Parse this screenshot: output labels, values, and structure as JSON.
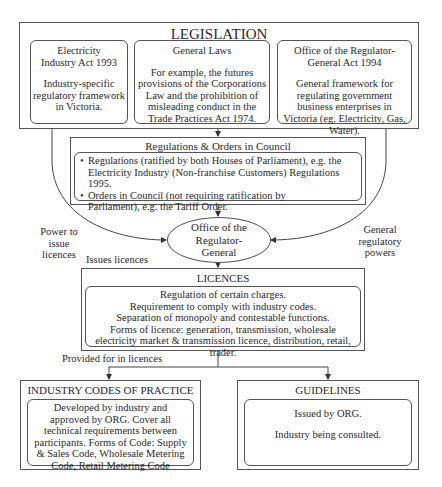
{
  "legislation": {
    "title": "LEGISLATION",
    "items": [
      {
        "heading": "Electricity Industry Act 1993",
        "body": "Industry-specific regulatory framework in Victoria."
      },
      {
        "heading": "General Laws",
        "body": "For example, the futures provisions of the Corporations Law and the prohibition of misleading conduct in the Trade Practices Act 1974."
      },
      {
        "heading": "Office of the Regulator-General Act 1994",
        "body": "General framework for regulating government business enterprises in Victoria (eg. Electricity, Gas, Water)."
      }
    ]
  },
  "regulations": {
    "title": "Regulations & Orders in Council",
    "bullets": [
      "Regulations (ratified by both Houses of Parliament), e.g. the Electricity Industry (Non-franchise Customers) Regulations 1995.",
      "Orders in Council (not requiring ratification by Parliament), e.g. the Tariff Order."
    ]
  },
  "org": {
    "label": "Office of the Regulator-General"
  },
  "edge_labels": {
    "power_to_issue": "Power to issue licences",
    "general_powers": "General regulatory powers",
    "issues_licences": "Issues licences",
    "provided_for": "Provided for in licences"
  },
  "licences": {
    "title": "LICENCES",
    "lines": [
      "Regulation of certain charges.",
      "Requirement to comply with industry codes.",
      "Separation of monopoly and contestable functions.",
      "Forms of licence: generation, transmission, wholesale electricity market & transmission licence, distribution, retail, trader."
    ]
  },
  "codes": {
    "title": "INDUSTRY CODES OF PRACTICE",
    "body": "Developed by industry and approved by ORG. Cover all technical requirements between participants. Forms of Code: Supply & Sales Code, Wholesale Metering Code, Retail Metering Code"
  },
  "guidelines": {
    "title": "GUIDELINES",
    "lines": [
      "Issued by ORG.",
      "Industry being consulted."
    ]
  }
}
